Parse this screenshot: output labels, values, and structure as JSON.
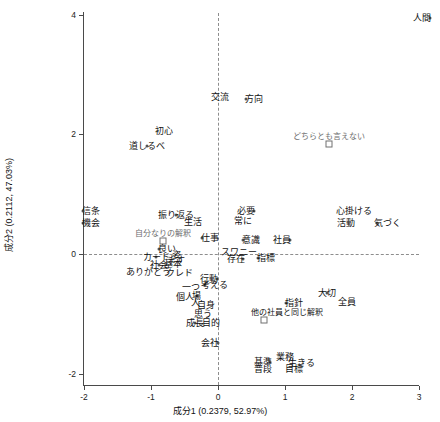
{
  "chart_data": {
    "type": "scatter",
    "title": "",
    "xlabel": "成分1  (0.2379, 52.97%)",
    "ylabel": "成分2 (0.2112, 47.03%)",
    "xlim": [
      -2.55,
      3.0
    ],
    "ylim": [
      -2.2,
      4.25
    ],
    "xticks": [
      "-2",
      "-1",
      "0",
      "1",
      "2",
      "3"
    ],
    "xtick_values": [
      -2,
      -1,
      0,
      1,
      2,
      3
    ],
    "yticks": [
      "4",
      "2",
      "0",
      "-2"
    ],
    "ytick_values": [
      4,
      2,
      0,
      -2
    ],
    "grid": "dashed reference lines at x=0 and y=0",
    "legend": "none",
    "marker_types": {
      "circle": "item / word point",
      "square": "category / response-level point"
    },
    "points": [
      {
        "label": "人間",
        "x": 3.16,
        "y": 3.95,
        "marker": "circle",
        "label_pos": "left"
      },
      {
        "label": "交流",
        "x": 0.14,
        "y": 2.62,
        "marker": "none",
        "label_pos": "left"
      },
      {
        "label": "方向",
        "x": 0.42,
        "y": 2.6,
        "marker": "circle",
        "label_pos": "right"
      },
      {
        "label": "初心",
        "x": -0.81,
        "y": 2.05,
        "marker": "none",
        "label_pos": "center"
      },
      {
        "label": "道しるべ",
        "x": -1.06,
        "y": 1.8,
        "marker": "circle",
        "label_pos": "center"
      },
      {
        "label": "どちらとも言えない",
        "x": 1.66,
        "y": 1.84,
        "marker": "square",
        "label_pos": "center",
        "color": "#6e6e6e"
      },
      {
        "label": "信条",
        "x": -2.01,
        "y": 0.72,
        "marker": "circle",
        "label_pos": "right"
      },
      {
        "label": "機会",
        "x": -2.01,
        "y": 0.52,
        "marker": "circle",
        "label_pos": "right"
      },
      {
        "label": "振り返る",
        "x": -0.62,
        "y": 0.66,
        "marker": "circle",
        "label_pos": "center"
      },
      {
        "label": "生活",
        "x": -0.37,
        "y": 0.53,
        "marker": "none",
        "label_pos": "center"
      },
      {
        "label": "必要",
        "x": 0.53,
        "y": 0.72,
        "marker": "circle",
        "label_pos": "left"
      },
      {
        "label": "常に",
        "x": 0.48,
        "y": 0.55,
        "marker": "none",
        "label_pos": "left"
      },
      {
        "label": "心掛ける",
        "x": 2.03,
        "y": 0.72,
        "marker": "none",
        "label_pos": "center"
      },
      {
        "label": "活動",
        "x": 2.03,
        "y": 0.52,
        "marker": "none",
        "label_pos": "left"
      },
      {
        "label": "気づく",
        "x": 2.38,
        "y": 0.52,
        "marker": "circle",
        "label_pos": "right"
      },
      {
        "label": "自分なりの解釈",
        "x": -0.82,
        "y": 0.22,
        "marker": "square",
        "label_pos": "center",
        "color": "#6e6e6e"
      },
      {
        "label": "仕事",
        "x": -0.24,
        "y": 0.26,
        "marker": "circle",
        "label_pos": "right"
      },
      {
        "label": "意識",
        "x": 0.38,
        "y": 0.24,
        "marker": "circle",
        "label_pos": "right"
      },
      {
        "label": "社員",
        "x": 1.07,
        "y": 0.24,
        "marker": "circle",
        "label_pos": "left"
      },
      {
        "label": "良い",
        "x": -0.88,
        "y": 0.08,
        "marker": "circle",
        "label_pos": "right"
      },
      {
        "label": "スワニー",
        "x": 0.32,
        "y": 0.04,
        "marker": "none",
        "label_pos": "center"
      },
      {
        "label": "存在",
        "x": 0.38,
        "y": -0.08,
        "marker": "circle",
        "label_pos": "left"
      },
      {
        "label": "指標",
        "x": 0.6,
        "y": -0.06,
        "marker": "circle",
        "label_pos": "right"
      },
      {
        "label": "カード",
        "x": -0.92,
        "y": -0.05,
        "marker": "circle",
        "label_pos": "center"
      },
      {
        "label": "姿",
        "x": -0.62,
        "y": -0.02,
        "marker": "none",
        "label_pos": "center"
      },
      {
        "label": "社会",
        "x": -0.88,
        "y": -0.18,
        "marker": "circle",
        "label_pos": "center"
      },
      {
        "label": "基本",
        "x": -0.67,
        "y": -0.16,
        "marker": "none",
        "label_pos": "center"
      },
      {
        "label": "ます",
        "x": -0.62,
        "y": -0.1,
        "marker": "none",
        "label_pos": "center"
      },
      {
        "label": "ありがとう",
        "x": -1.03,
        "y": -0.3,
        "marker": "none",
        "label_pos": "center"
      },
      {
        "label": "クレド",
        "x": -0.58,
        "y": -0.32,
        "marker": "none",
        "label_pos": "center"
      },
      {
        "label": "行動",
        "x": -0.02,
        "y": -0.42,
        "marker": "circle",
        "label_pos": "left"
      },
      {
        "label": "一つ",
        "x": -0.41,
        "y": -0.56,
        "marker": "none",
        "label_pos": "center"
      },
      {
        "label": "考える",
        "x": -0.2,
        "y": -0.52,
        "marker": "circle",
        "label_pos": "right"
      },
      {
        "label": "個人",
        "x": -0.5,
        "y": -0.72,
        "marker": "none",
        "label_pos": "center"
      },
      {
        "label": "場",
        "x": -0.32,
        "y": -0.7,
        "marker": "circle",
        "label_pos": "center"
      },
      {
        "label": "人",
        "x": -0.33,
        "y": -0.82,
        "marker": "none",
        "label_pos": "center"
      },
      {
        "label": "自身",
        "x": -0.18,
        "y": -0.86,
        "marker": "none",
        "label_pos": "center"
      },
      {
        "label": "思う",
        "x": -0.22,
        "y": -1.0,
        "marker": "none",
        "label_pos": "center"
      },
      {
        "label": "成長",
        "x": -0.34,
        "y": -1.15,
        "marker": "circle",
        "label_pos": "center"
      },
      {
        "label": "目的",
        "x": -0.1,
        "y": -1.16,
        "marker": "none",
        "label_pos": "center"
      },
      {
        "label": "大切",
        "x": 1.62,
        "y": -0.66,
        "marker": "circle",
        "label_pos": "center"
      },
      {
        "label": "全員",
        "x": 1.93,
        "y": -0.8,
        "marker": "none",
        "label_pos": "center"
      },
      {
        "label": "指針",
        "x": 1.02,
        "y": -0.82,
        "marker": "circle",
        "label_pos": "right"
      },
      {
        "label": "他の社員と同じ解釈",
        "x": 0.68,
        "y": -1.1,
        "marker": "square",
        "label_pos": "right",
        "color": "#444"
      },
      {
        "label": "会社",
        "x": 0.0,
        "y": -1.48,
        "marker": "circle",
        "label_pos": "left"
      },
      {
        "label": "業務",
        "x": 1.0,
        "y": -1.72,
        "marker": "none",
        "label_pos": "center"
      },
      {
        "label": "基準",
        "x": 0.78,
        "y": -1.8,
        "marker": "circle",
        "label_pos": "left"
      },
      {
        "label": "生きる",
        "x": 1.1,
        "y": -1.82,
        "marker": "none",
        "label_pos": "right"
      },
      {
        "label": "普段",
        "x": 0.78,
        "y": -1.92,
        "marker": "none",
        "label_pos": "left"
      },
      {
        "label": "目標",
        "x": 1.02,
        "y": -1.92,
        "marker": "none",
        "label_pos": "right"
      }
    ]
  },
  "colors": {
    "axis": "#4a4a4a",
    "grid": "#8d8d8d",
    "point": "#555555",
    "text": "#111111",
    "muted": "#6e6e6e",
    "background": "#ffffff"
  }
}
